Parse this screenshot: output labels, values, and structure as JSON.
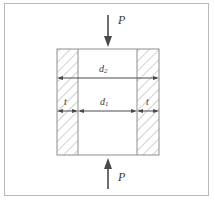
{
  "figure": {
    "type": "engineering-cross-section-diagram",
    "background_color": "#ffffff",
    "frame_color": "#b9b9b9",
    "line_color": "#4a4a4a",
    "hatch_color": "#9a9a9a",
    "text_color": "#3a3a3a"
  },
  "loads": {
    "top": {
      "label": "P",
      "arrow_direction": "down",
      "icon": "arrow-down-icon"
    },
    "bottom": {
      "label": "P",
      "arrow_direction": "up",
      "icon": "arrow-up-icon"
    }
  },
  "dimensions": {
    "outer": {
      "symbol": "d",
      "subscript": "2",
      "label": "d2",
      "arrow_type": "double-headed",
      "span": "outer-width"
    },
    "inner": {
      "symbol": "d",
      "subscript": "1",
      "label": "d1",
      "arrow_type": "double-headed",
      "span": "inner-width"
    },
    "wall_left": {
      "symbol": "t",
      "label": "t",
      "arrow_type": "double-headed",
      "span": "left-wall-thickness"
    },
    "wall_right": {
      "symbol": "t",
      "label": "t",
      "arrow_type": "double-headed",
      "span": "right-wall-thickness"
    }
  },
  "geometry": {
    "outer_left": 57,
    "outer_right": 159,
    "outer_top": 49,
    "outer_bottom": 155,
    "inner_left": 78,
    "inner_right": 137,
    "d2_arrow_y": 78,
    "d1_arrow_y": 111,
    "center_x": 108
  }
}
